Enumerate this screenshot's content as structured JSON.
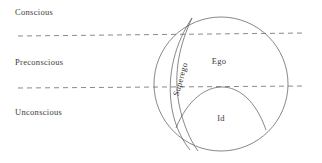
{
  "diagram": {
    "levels": [
      {
        "id": "conscious",
        "label": "Conscious"
      },
      {
        "id": "preconscious",
        "label": "Preconscious"
      },
      {
        "id": "unconscious",
        "label": "Unconscious"
      }
    ],
    "regions": [
      {
        "id": "superego",
        "label": "Superego"
      },
      {
        "id": "ego",
        "label": "Ego"
      },
      {
        "id": "id",
        "label": "Id"
      }
    ],
    "colors": {
      "background": "#ffffff",
      "stroke": "#555555",
      "dashed_line": "#6b6b6b",
      "text": "#3b3b3b"
    },
    "geometry": {
      "circle_center_x": 221,
      "circle_center_y": 84,
      "circle_radius": 67,
      "dash_line_1_y": 35,
      "dash_line_2_y": 87,
      "dash_line_start_x": 18,
      "dash_line_end_x": 306
    }
  }
}
